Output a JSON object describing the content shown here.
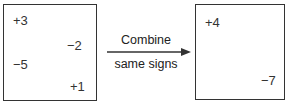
{
  "left_box": {
    "items": [
      "+3",
      "−2",
      "−5",
      "+1"
    ]
  },
  "arrow": {
    "label_top": "Combine",
    "label_bottom": "same signs"
  },
  "right_box": {
    "items": [
      "+4",
      "−7"
    ]
  },
  "colors": {
    "stroke": "#333333",
    "text": "#2a2a2a"
  }
}
